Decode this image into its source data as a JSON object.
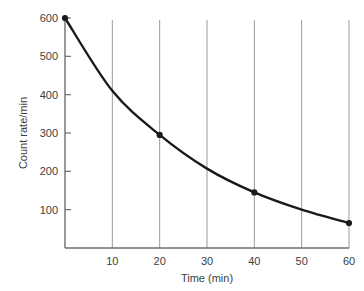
{
  "chart_data": {
    "type": "line",
    "title": "",
    "subtitle": "",
    "xlabel": "Time (min)",
    "ylabel": "Count rate/min",
    "xlim": [
      0,
      60
    ],
    "ylim": [
      0,
      600
    ],
    "xticks": [
      "10",
      "20",
      "30",
      "40",
      "50",
      "60"
    ],
    "xtick_values": [
      10,
      20,
      30,
      40,
      50,
      60
    ],
    "yticks": [
      "100",
      "200",
      "300",
      "400",
      "500",
      "600"
    ],
    "ytick_values": [
      100,
      200,
      300,
      400,
      500,
      600
    ],
    "grid": "vertical-only",
    "legend": "none",
    "series": [
      {
        "name": "Count rate",
        "x": [
          0,
          10,
          20,
          30,
          40,
          50,
          60
        ],
        "values": [
          600,
          410,
          295,
          207,
          145,
          100,
          65
        ],
        "marked_points": [
          {
            "x": 0,
            "y": 600
          },
          {
            "x": 20,
            "y": 295
          },
          {
            "x": 40,
            "y": 145
          },
          {
            "x": 60,
            "y": 65
          }
        ],
        "line_color": "#1a1a1a",
        "marker_color": "#1a1a1a"
      }
    ],
    "annotations": [],
    "colors": {
      "axis": "#6e6e6e",
      "gridline": "#9a9a9a",
      "curve": "#1a1a1a",
      "text": "#3d3d3d",
      "background": "#ffffff"
    }
  },
  "axes": {
    "y_axis_title": "Count rate/min",
    "x_axis_title": "Time (min)",
    "y_labels": [
      "600",
      "500",
      "400",
      "300",
      "200",
      "100"
    ],
    "x_labels": [
      "10",
      "20",
      "30",
      "40",
      "50",
      "60"
    ]
  }
}
